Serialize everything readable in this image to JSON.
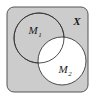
{
  "figure": {
    "kind": "venn-diagram",
    "universe_label": "X",
    "set_labels": {
      "left_base": "M",
      "left_subscript": "1",
      "right_base": "M",
      "right_subscript": "2"
    },
    "colors": {
      "page_background": "#ffffff",
      "universe_fill": "#cccccc",
      "universe_stroke": "#555555",
      "circle_stroke": "#3a3a3a",
      "unshaded_fill": "#ffffff",
      "label_color": "#1a1a1a"
    },
    "geometry": {
      "universe_rect": {
        "x": 7,
        "y": 7,
        "width": 81,
        "height": 85,
        "corner_radius": 7
      },
      "left_circle": {
        "cx": 39,
        "cy": 38,
        "r": 25
      },
      "right_circle": {
        "cx": 62,
        "cy": 61,
        "r": 24
      },
      "universe_label_pos": {
        "x": 77,
        "y": 22
      },
      "left_label_pos": {
        "x": 33,
        "y": 31
      },
      "right_label_pos": {
        "x": 63,
        "y": 70
      }
    },
    "shading": {
      "shaded_description": "X minus M2",
      "shaded_regions": [
        "universe-outside-circles",
        "left-circle-only",
        "left-circle-minus-right"
      ],
      "unshaded_regions": [
        "right-circle-interior",
        "intersection"
      ]
    }
  }
}
